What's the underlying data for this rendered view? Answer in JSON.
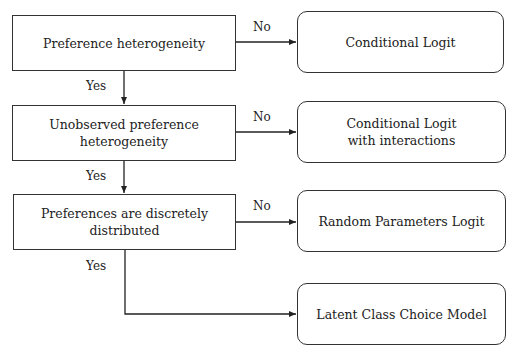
{
  "diagram": {
    "decisions": [
      {
        "label": "Preference heterogeneity"
      },
      {
        "label": "Unobserved preference heterogeneity"
      },
      {
        "label": "Preferences are discretely distributed"
      }
    ],
    "outcomes": [
      {
        "label": "Conditional Logit"
      },
      {
        "label": "Conditional Logit with interactions"
      },
      {
        "label": "Random Parameters Logit"
      },
      {
        "label": "Latent Class Choice Model"
      }
    ],
    "edge_labels": {
      "no": "No",
      "yes": "Yes"
    },
    "edges": [
      {
        "from": "Preference heterogeneity",
        "to": "Conditional Logit",
        "label": "No"
      },
      {
        "from": "Preference heterogeneity",
        "to": "Unobserved preference heterogeneity",
        "label": "Yes"
      },
      {
        "from": "Unobserved preference heterogeneity",
        "to": "Conditional Logit with interactions",
        "label": "No"
      },
      {
        "from": "Unobserved preference heterogeneity",
        "to": "Preferences are discretely distributed",
        "label": "Yes"
      },
      {
        "from": "Preferences are discretely distributed",
        "to": "Random Parameters Logit",
        "label": "No"
      },
      {
        "from": "Preferences are discretely distributed",
        "to": "Latent Class Choice Model",
        "label": "Yes"
      }
    ]
  }
}
